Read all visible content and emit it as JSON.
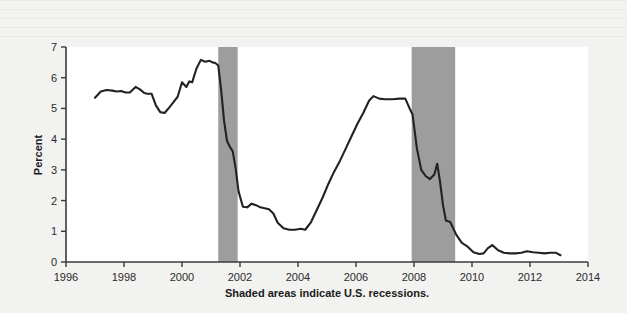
{
  "figure": {
    "caption": "Shaded areas indicate U.S. recessions.",
    "background_color": "#f2f2f0",
    "plot_background_color": "#ffffff",
    "line_color": "#222222",
    "recession_color": "#9d9d9d"
  },
  "chart_data": {
    "type": "line",
    "title": "",
    "subtitle": "",
    "xlabel": "",
    "ylabel": "Percent",
    "caption": "Shaded areas indicate U.S. recessions.",
    "grid": false,
    "legend": false,
    "legend_position": "none",
    "xlim": [
      1996,
      2014
    ],
    "ylim": [
      0,
      7
    ],
    "xticks": [
      1996,
      1998,
      2000,
      2002,
      2004,
      2006,
      2008,
      2010,
      2012,
      2014
    ],
    "xtick_labels": [
      "1996",
      "1998",
      "2000",
      "2002",
      "2004",
      "2006",
      "2008",
      "2010",
      "2012",
      "2014"
    ],
    "yticks": [
      0,
      1,
      2,
      3,
      4,
      5,
      6,
      7
    ],
    "ytick_labels": [
      "0",
      "1",
      "2",
      "3",
      "4",
      "5",
      "6",
      "7"
    ],
    "shaded_regions": [
      {
        "label": "2001 recession",
        "x_start": 2001.25,
        "x_end": 2001.92
      },
      {
        "label": "2007-2009 recession",
        "x_start": 2007.92,
        "x_end": 2009.42
      }
    ],
    "series": [
      {
        "name": "Percent",
        "x": [
          1997.0,
          1997.2,
          1997.4,
          1997.6,
          1997.75,
          1997.9,
          1998.05,
          1998.2,
          1998.4,
          1998.55,
          1998.7,
          1998.8,
          1998.95,
          1999.1,
          1999.25,
          1999.4,
          1999.55,
          1999.7,
          1999.85,
          2000.0,
          2000.15,
          2000.25,
          2000.35,
          2000.5,
          2000.65,
          2000.8,
          2000.95,
          2001.05,
          2001.15,
          2001.25,
          2001.35,
          2001.45,
          2001.55,
          2001.65,
          2001.75,
          2001.85,
          2001.95,
          2002.1,
          2002.25,
          2002.4,
          2002.55,
          2002.7,
          2002.85,
          2003.0,
          2003.15,
          2003.3,
          2003.5,
          2003.7,
          2003.9,
          2004.1,
          2004.25,
          2004.45,
          2004.65,
          2004.85,
          2005.05,
          2005.25,
          2005.45,
          2005.65,
          2005.85,
          2006.05,
          2006.25,
          2006.45,
          2006.6,
          2006.8,
          2007.0,
          2007.25,
          2007.5,
          2007.7,
          2007.85,
          2007.95,
          2008.1,
          2008.25,
          2008.4,
          2008.55,
          2008.7,
          2008.8,
          2008.9,
          2009.0,
          2009.1,
          2009.25,
          2009.45,
          2009.65,
          2009.85,
          2010.05,
          2010.25,
          2010.4,
          2010.55,
          2010.7,
          2010.9,
          2011.1,
          2011.3,
          2011.5,
          2011.7,
          2011.9,
          2012.1,
          2012.3,
          2012.5,
          2012.7,
          2012.9,
          2013.05
        ],
        "y": [
          5.35,
          5.55,
          5.6,
          5.58,
          5.55,
          5.57,
          5.52,
          5.52,
          5.7,
          5.62,
          5.5,
          5.48,
          5.48,
          5.1,
          4.88,
          4.85,
          5.02,
          5.2,
          5.38,
          5.85,
          5.7,
          5.88,
          5.85,
          6.3,
          6.58,
          6.52,
          6.55,
          6.5,
          6.48,
          6.4,
          5.6,
          4.6,
          3.95,
          3.75,
          3.6,
          3.05,
          2.3,
          1.8,
          1.78,
          1.9,
          1.85,
          1.78,
          1.75,
          1.72,
          1.58,
          1.28,
          1.1,
          1.05,
          1.05,
          1.08,
          1.05,
          1.3,
          1.7,
          2.1,
          2.55,
          2.95,
          3.3,
          3.7,
          4.1,
          4.5,
          4.85,
          5.25,
          5.4,
          5.32,
          5.3,
          5.3,
          5.32,
          5.32,
          5.0,
          4.8,
          3.7,
          3.0,
          2.8,
          2.7,
          2.85,
          3.2,
          2.6,
          1.85,
          1.35,
          1.3,
          0.9,
          0.62,
          0.5,
          0.32,
          0.26,
          0.28,
          0.45,
          0.55,
          0.38,
          0.3,
          0.28,
          0.28,
          0.3,
          0.35,
          0.32,
          0.3,
          0.28,
          0.3,
          0.3,
          0.22
        ]
      }
    ]
  }
}
